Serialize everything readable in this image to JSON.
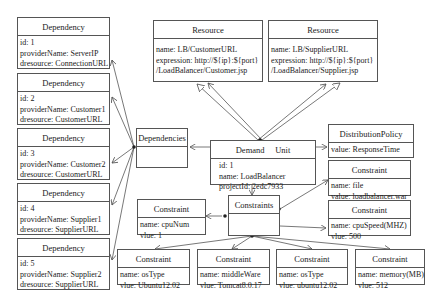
{
  "diagram": {
    "dependencies": [
      {
        "title": "Dependency",
        "id": "id: 1",
        "providerName": "providerName: ServerIP",
        "dresource": "dresource: ConnectionURL"
      },
      {
        "title": "Dependency",
        "id": "id: 2",
        "providerName": "providerName: Customer1",
        "dresource": "dresource: CustomerURL"
      },
      {
        "title": "Dependency",
        "id": "id: 3",
        "providerName": "providerName: Customer2",
        "dresource": "dresource: CustomerURL"
      },
      {
        "title": "Dependency",
        "id": "id: 4",
        "providerName": "providerName: Supplier1",
        "dresource": "dresource: SupplierURL"
      },
      {
        "title": "Dependency",
        "id": "id: 5",
        "providerName": "providerName: Supplier2",
        "dresource": "dresource: SupplierURL"
      }
    ],
    "resources": [
      {
        "title": "Resource",
        "name": "name: LB/CustomerURL",
        "expression": "expression: http://${ip}:${port}",
        "path": "/LoadBalancer/Customer.jsp"
      },
      {
        "title": "Resource",
        "name": "name: LB/SupplierURL",
        "expression": "expression: http://${ip}:${port}",
        "path": "/LoadBalancer/Supplier.jsp"
      }
    ],
    "dependencies_group": {
      "title": "Dependencies"
    },
    "demand_unit": {
      "title": "Demand     Unit",
      "id": "id: 1",
      "name": "name: LoadBalancer",
      "projectId": "projectId: 2edc7933"
    },
    "distribution_policy": {
      "title": "DistributionPolicy",
      "value": "value: ResponseTime"
    },
    "constraints_group": {
      "title": "Constraints"
    },
    "constraints": [
      {
        "title": "Constraint",
        "line1": "name: cpuNum",
        "line2": "vlue: 1"
      },
      {
        "title": "Constraint",
        "line1": "name: file",
        "line2": "value: loadbalancer.war"
      },
      {
        "title": "Constraint",
        "line1": "name: cpuSpeed(MHZ)",
        "line2": "vlue: 500"
      },
      {
        "title": "Constraint",
        "line1": "name: osType",
        "line2": "vlue: Ubuntu12.02"
      },
      {
        "title": "Constraint",
        "line1": "name: middleWare",
        "line2": "vlue: Tomcat8.0.17"
      },
      {
        "title": "Constraint",
        "line1": "name: osType",
        "line2": "vlue: ubuntu12.02"
      },
      {
        "title": "Constraint",
        "line1": "name: memory(MB)",
        "line2": "vlue: 512"
      }
    ],
    "colors": {
      "line": "#555555",
      "border": "#555555",
      "background": "#ffffff"
    }
  }
}
